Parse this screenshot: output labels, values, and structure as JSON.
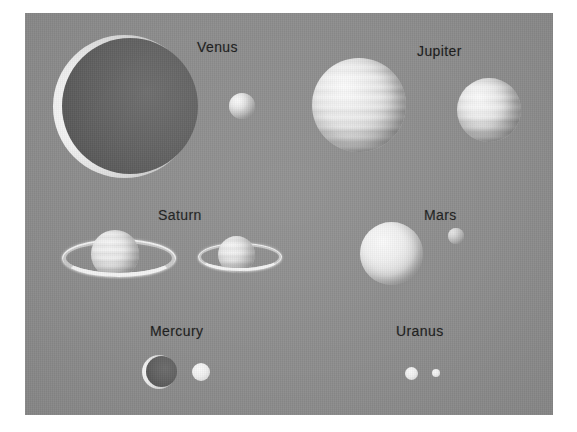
{
  "figure": {
    "background_color": "#ffffff",
    "plate_color": "#8d8d8d",
    "label_color": "#1c1c1c"
  },
  "labels": [
    {
      "id": "venus",
      "text": "Venus",
      "x": 197,
      "y": 39
    },
    {
      "id": "jupiter",
      "text": "Jupiter",
      "x": 417,
      "y": 43
    },
    {
      "id": "saturn",
      "text": "Saturn",
      "x": 158,
      "y": 207
    },
    {
      "id": "mars",
      "text": "Mars",
      "x": 424,
      "y": 207
    },
    {
      "id": "mercury",
      "text": "Mercury",
      "x": 150,
      "y": 323
    },
    {
      "id": "uranus",
      "text": "Uranus",
      "x": 396,
      "y": 323
    }
  ],
  "planets": [
    {
      "id": "venus-large",
      "group": "Venus",
      "style": "crescent",
      "cx": 125,
      "cy": 107,
      "diameter": 143
    },
    {
      "id": "venus-small",
      "group": "Venus",
      "style": "bright",
      "cx": 242,
      "cy": 106,
      "diameter": 26
    },
    {
      "id": "jupiter-large",
      "group": "Jupiter",
      "style": "gas",
      "cx": 359,
      "cy": 105,
      "diameter": 94
    },
    {
      "id": "jupiter-small",
      "group": "Jupiter",
      "style": "gas",
      "cx": 489,
      "cy": 110,
      "diameter": 64
    },
    {
      "id": "saturn-large",
      "group": "Saturn",
      "style": "ringed",
      "cx": 115,
      "cy": 254,
      "diameter": 48,
      "ring_width": 106,
      "ring_height": 30
    },
    {
      "id": "saturn-small",
      "group": "Saturn",
      "style": "ringed",
      "cx": 237,
      "cy": 254,
      "diameter": 37,
      "ring_width": 78,
      "ring_height": 22
    },
    {
      "id": "mars-large",
      "group": "Mars",
      "style": "bright",
      "cx": 392,
      "cy": 254,
      "diameter": 63
    },
    {
      "id": "mars-small",
      "group": "Mars",
      "style": "bright",
      "cx": 456,
      "cy": 256,
      "diameter": 16
    },
    {
      "id": "mercury-large",
      "group": "Mercury",
      "style": "crescent",
      "cx": 159,
      "cy": 372,
      "diameter": 34
    },
    {
      "id": "mercury-small",
      "group": "Mercury",
      "style": "bright-flat",
      "cx": 201,
      "cy": 372,
      "diameter": 18
    },
    {
      "id": "uranus-large",
      "group": "Uranus",
      "style": "bright-flat",
      "cx": 412,
      "cy": 373,
      "diameter": 13
    },
    {
      "id": "uranus-small",
      "group": "Uranus",
      "style": "bright-flat",
      "cx": 436,
      "cy": 373,
      "diameter": 8
    }
  ]
}
